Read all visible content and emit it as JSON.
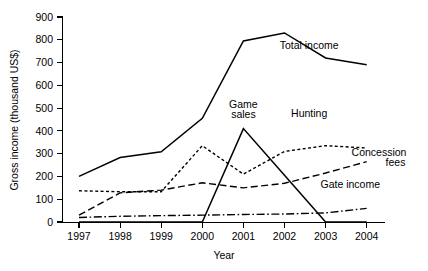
{
  "chart_data": {
    "type": "line",
    "title": "",
    "xlabel": "Year",
    "ylabel": "Gross income (thousand US$)",
    "categories": [
      "1997",
      "1998",
      "1999",
      "2000",
      "2001",
      "2002",
      "2003",
      "2004"
    ],
    "x": [
      1997,
      1998,
      1999,
      2000,
      2001,
      2002,
      2003,
      2004
    ],
    "xlim": [
      1997,
      2004
    ],
    "ylim": [
      0,
      900
    ],
    "yticks": [
      0,
      100,
      200,
      300,
      400,
      500,
      600,
      700,
      800,
      900
    ],
    "xticks": [
      "1997",
      "1998",
      "1999",
      "2000",
      "2001",
      "2002",
      "2003",
      "2004"
    ],
    "grid": false,
    "legend": "inline-annotations",
    "series": [
      {
        "name": "Total income",
        "style": "solid",
        "label": "Total income",
        "values": [
          200,
          283,
          308,
          455,
          795,
          830,
          720,
          690
        ]
      },
      {
        "name": "Hunting",
        "style": "dotted",
        "label": "Hunting",
        "values": [
          137,
          133,
          133,
          335,
          210,
          310,
          335,
          325
        ]
      },
      {
        "name": "Concession fees",
        "style": "dashed",
        "label": "Concession fees",
        "values": [
          30,
          128,
          140,
          172,
          150,
          170,
          215,
          265
        ]
      },
      {
        "name": "Game sales",
        "style": "solid",
        "label": "Game sales",
        "values": [
          0,
          0,
          0,
          0,
          410,
          205,
          0,
          0
        ]
      },
      {
        "name": "Gate income",
        "style": "dashdot",
        "label": "Gate income",
        "values": [
          20,
          25,
          28,
          30,
          33,
          35,
          40,
          60
        ]
      }
    ],
    "annotations": [
      {
        "text": "Total income",
        "x": 2002.6,
        "y": 760
      },
      {
        "text": "Game",
        "x": 2001.0,
        "y": 500
      },
      {
        "text": "sales",
        "x": 2001.0,
        "y": 455
      },
      {
        "text": "Hunting",
        "x": 2002.6,
        "y": 460
      },
      {
        "text": "Concession",
        "x": 2004.3,
        "y": 290
      },
      {
        "text": "fees",
        "x": 2004.7,
        "y": 248
      },
      {
        "text": "Gate income",
        "x": 2003.6,
        "y": 148
      }
    ]
  },
  "colors": {
    "line": "#000000",
    "axis": "#000000",
    "text": "#000000",
    "background": "#ffffff"
  }
}
